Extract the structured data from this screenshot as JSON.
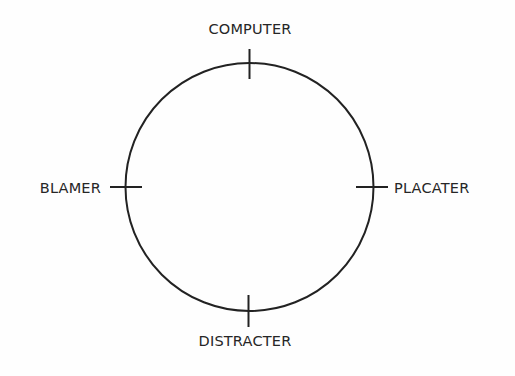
{
  "diagram": {
    "type": "circular-compass",
    "stroke_color": "#222222",
    "text_color": "#262626",
    "background_color": "#fefefe",
    "circle": {
      "cx": 249.5,
      "cy": 187,
      "r": 124
    },
    "nodes": [
      {
        "id": "top",
        "position": "top",
        "label": "COMPUTER"
      },
      {
        "id": "left",
        "position": "left",
        "label": "BLAMER"
      },
      {
        "id": "right",
        "position": "right",
        "label": "PLACATER"
      },
      {
        "id": "bottom",
        "position": "bottom",
        "label": "DISTRACTER"
      }
    ]
  }
}
